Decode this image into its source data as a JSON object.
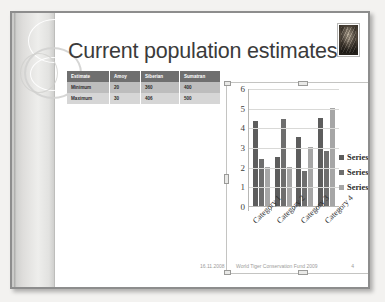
{
  "slide": {
    "title": "Current population estimates",
    "photo_alt": "tiger-photo"
  },
  "table": {
    "headers": [
      "Estimate",
      "Amoy",
      "Siberian",
      "Sumatran"
    ],
    "rows": [
      [
        "Minimum",
        "20",
        "360",
        "400"
      ],
      [
        "Maximum",
        "30",
        "406",
        "500"
      ]
    ]
  },
  "chart_data": {
    "type": "bar",
    "title": "",
    "xlabel": "",
    "ylabel": "",
    "ylim": [
      0,
      6
    ],
    "yticks": [
      "0",
      "1",
      "2",
      "3",
      "4",
      "5",
      "6"
    ],
    "grid": true,
    "legend_position": "right",
    "categories": [
      "Category 1",
      "Category 2",
      "Category 3",
      "Category 4"
    ],
    "series": [
      {
        "name": "Series 1",
        "color": "#5d5d5d",
        "values": [
          4.3,
          2.5,
          3.5,
          4.5
        ]
      },
      {
        "name": "Series 2",
        "color": "#6e6e6e",
        "values": [
          2.4,
          4.4,
          1.8,
          2.8
        ]
      },
      {
        "name": "Series 3",
        "color": "#a6a6a6",
        "values": [
          2.0,
          2.0,
          3.0,
          5.0
        ]
      }
    ]
  },
  "footer": {
    "date": "16.11.2008",
    "text": "World Tiger Conservation Fund 2009",
    "page": "4"
  }
}
